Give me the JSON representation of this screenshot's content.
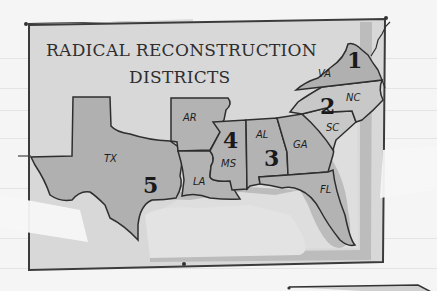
{
  "map": {
    "title_line1": "RADICAL RECONSTRUCTION",
    "title_line2": "DISTRICTS",
    "districts": [
      {
        "number": "1",
        "states": [
          "VA"
        ]
      },
      {
        "number": "2",
        "states": [
          "NC",
          "SC"
        ]
      },
      {
        "number": "3",
        "states": [
          "AL",
          "GA",
          "FL"
        ]
      },
      {
        "number": "4",
        "states": [
          "AR",
          "MS"
        ]
      },
      {
        "number": "5",
        "states": [
          "TX",
          "LA"
        ]
      }
    ],
    "state_labels": {
      "va": "VA",
      "nc": "NC",
      "sc": "SC",
      "ga": "GA",
      "al": "AL",
      "fl": "FL",
      "ms": "MS",
      "ar": "AR",
      "la": "LA",
      "tx": "TX"
    },
    "district_labels": {
      "d1": "1",
      "d2": "2",
      "d3": "3",
      "d4": "4",
      "d5": "5"
    },
    "colors": {
      "paper": "#d9d9d9",
      "states": "#b3b3b3",
      "coast_shadow": "#bdbdbd",
      "border": "#3a3a3a",
      "tape": "#f7f7f7"
    }
  }
}
